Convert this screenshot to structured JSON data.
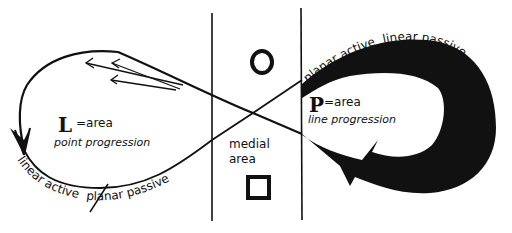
{
  "diagram": {
    "type": "figure-eight loop diagram",
    "colors": {
      "ink": "#111111",
      "background": "#ffffff"
    },
    "center_column": {
      "label_line1": "medial",
      "label_line2": "area",
      "top_symbol": "circle",
      "bottom_symbol": "square"
    },
    "left_loop": {
      "big_letter": "L",
      "equation": "=area",
      "subtitle": "point progression",
      "curve_label_left": "linear active",
      "curve_label_right": "planar passive",
      "stroke": "thin"
    },
    "right_loop": {
      "big_letter": "P",
      "equation": "=area",
      "subtitle": "line progression",
      "curve_label_left": "planar active",
      "curve_label_right": "linear passive",
      "stroke": "thick"
    }
  }
}
